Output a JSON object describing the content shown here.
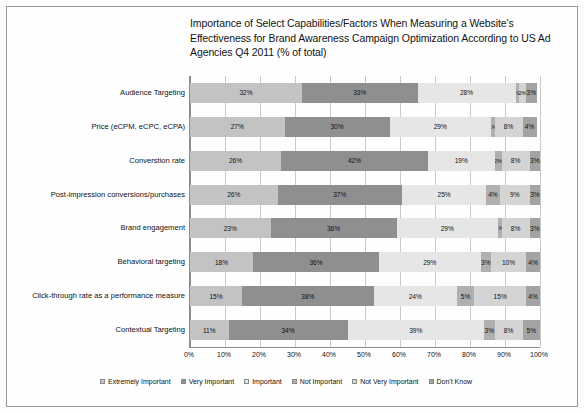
{
  "chart_data": {
    "type": "bar",
    "orientation": "horizontal",
    "stacked": true,
    "normalized_percent": true,
    "title": "Importance of Select Capabilities/Factors When Measuring a Website's Effectiveness for Brand Awareness Campaign Optimization According to US Ad Agencies Q4 2011 (% of total)",
    "xlabel": "",
    "ylabel": "",
    "xlim": [
      0,
      100
    ],
    "grid": true,
    "legend_position": "bottom",
    "xticks": [
      "0%",
      "10%",
      "20%",
      "30%",
      "40%",
      "50%",
      "60%",
      "70%",
      "80%",
      "90%",
      "100%"
    ],
    "xtick_values": [
      0,
      10,
      20,
      30,
      40,
      50,
      60,
      70,
      80,
      90,
      100
    ],
    "categories": [
      "Audience Targeting",
      "Price (eCPM, eCPC, eCPA)",
      "Converstion rate",
      "Post-impression conversions/purchases",
      "Brand engagement",
      "Behavioral targeting",
      "Click-through rate as a performance measure",
      "Contextual Targeting"
    ],
    "series": [
      {
        "name": "Extremely Important",
        "color": "#c3c3c3",
        "values": [
          32,
          27,
          26,
          26,
          23,
          18,
          15,
          11
        ],
        "labels": [
          "32%",
          "27%",
          "26%",
          "26%",
          "23%",
          "18%",
          "15%",
          "11%"
        ]
      },
      {
        "name": "Very Important",
        "color": "#8f8f8f",
        "values": [
          33,
          30,
          42,
          37,
          36,
          36,
          38,
          34
        ],
        "labels": [
          "33%",
          "30%",
          "42%",
          "37%",
          "36%",
          "36%",
          "38%",
          "34%"
        ]
      },
      {
        "name": "Important",
        "color": "#e6e6e6",
        "values": [
          28,
          29,
          19,
          25,
          29,
          29,
          24,
          39
        ],
        "labels": [
          "28%",
          "29%",
          "19%",
          "25%",
          "29%",
          "29%",
          "24%",
          "39%"
        ]
      },
      {
        "name": "Not Important",
        "color": "#b0b0b0",
        "values": [
          1,
          1,
          2,
          4,
          1,
          3,
          5,
          3
        ],
        "labels": [
          "1%",
          "1%",
          "2%",
          "4%",
          "1%",
          "3%",
          "5%",
          "3%"
        ]
      },
      {
        "name": "Not Very Important",
        "color": "#d4d4d4",
        "values": [
          2,
          8,
          8,
          9,
          8,
          10,
          15,
          8
        ],
        "labels": [
          "2%",
          "8%",
          "8%",
          "9%",
          "8%",
          "10%",
          "15%",
          "8%"
        ]
      },
      {
        "name": "Don't Know",
        "color": "#a3a3a3",
        "values": [
          3,
          4,
          3,
          3,
          3,
          4,
          4,
          5
        ],
        "labels": [
          "3%",
          "4%",
          "3%",
          "3%",
          "3%",
          "4%",
          "4%",
          "5%"
        ]
      }
    ]
  }
}
